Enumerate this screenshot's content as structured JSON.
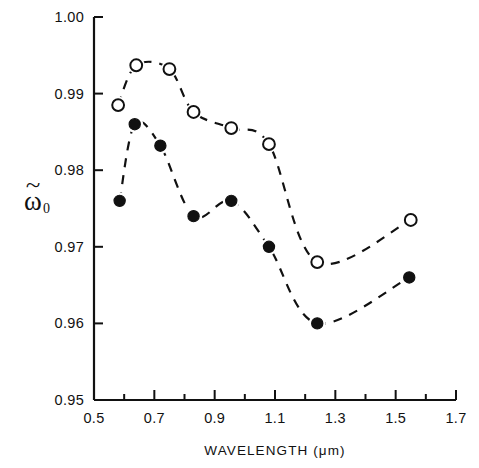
{
  "figure": {
    "background_color": "#ffffff",
    "ink_color": "#111111"
  },
  "axes": {
    "y_label_glyph": "ω",
    "y_label_tilde": "̃",
    "y_label_subscript": "0",
    "x_title": "WAVELENGTH (μm)"
  },
  "chart_data": {
    "type": "scatter",
    "title": "",
    "subtitle": "",
    "xlabel": "WAVELENGTH (μm)",
    "ylabel": "ω̃0",
    "xlim": [
      0.5,
      1.7
    ],
    "ylim": [
      0.95,
      1.0
    ],
    "xticks": [
      0.5,
      0.7,
      0.9,
      1.1,
      1.3,
      1.5,
      1.7
    ],
    "xtick_labels": [
      "0.5",
      "0.7",
      "0.9",
      "1.1",
      "1.3",
      "1.5",
      "1.7"
    ],
    "x_minor_ticks": [
      0.6,
      0.8,
      1.0,
      1.2,
      1.4,
      1.6
    ],
    "yticks": [
      0.95,
      0.96,
      0.97,
      0.98,
      0.99,
      1.0
    ],
    "ytick_labels": [
      "0.95",
      "0.96",
      "0.97",
      "0.98",
      "0.99",
      "1.00"
    ],
    "grid": false,
    "legend": null,
    "legend_position": "none",
    "series": [
      {
        "name": "open-circle-series",
        "marker": "open-circle",
        "marker_fill": "#ffffff",
        "marker_edge": "#111111",
        "line_style": "dashed",
        "x": [
          0.58,
          0.64,
          0.75,
          0.83,
          0.955,
          1.08,
          1.24,
          1.55
        ],
        "values": [
          0.9885,
          0.9937,
          0.9932,
          0.9876,
          0.9855,
          0.9834,
          0.968,
          0.9735
        ]
      },
      {
        "name": "filled-circle-series",
        "marker": "filled-circle",
        "marker_fill": "#111111",
        "marker_edge": "#111111",
        "line_style": "dashed",
        "x": [
          0.585,
          0.635,
          0.72,
          0.83,
          0.955,
          1.08,
          1.24,
          1.545
        ],
        "values": [
          0.976,
          0.986,
          0.9832,
          0.974,
          0.976,
          0.97,
          0.96,
          0.966
        ]
      }
    ]
  }
}
